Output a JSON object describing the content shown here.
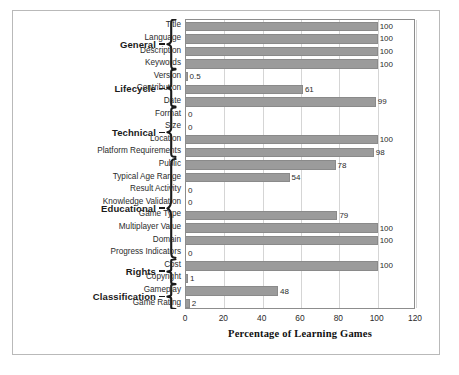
{
  "chart_data": {
    "type": "bar",
    "orientation": "horizontal",
    "title": "",
    "xlabel": "Percentage of Learning Games",
    "ylabel": "",
    "xlim": [
      0,
      120
    ],
    "xticks": [
      0,
      20,
      40,
      60,
      80,
      100,
      120
    ],
    "grid": true,
    "legend": false,
    "bar_color": "#9b9b9b",
    "categories": [
      "Title",
      "Language",
      "Description",
      "Keywords",
      "Version",
      "Contribution",
      "Date",
      "Format",
      "Size",
      "Location",
      "Platform Requirements",
      "Public",
      "Typical Age Range",
      "Result Activity",
      "Knowledge Validation",
      "Game Type",
      "Multiplayer Value",
      "Domain",
      "Progress Indicators",
      "Cost",
      "Copyright",
      "Gameplay",
      "Game Rating"
    ],
    "values": [
      100,
      100,
      100,
      100,
      0.5,
      61,
      99,
      0,
      0,
      100,
      98,
      78,
      54,
      0,
      0,
      79,
      100,
      100,
      0,
      100,
      1,
      48,
      2
    ],
    "value_labels": [
      "100",
      "100",
      "100",
      "100",
      "0.5",
      "61",
      "99",
      "0",
      "0",
      "100",
      "98",
      "78",
      "54",
      "0",
      "0",
      "79",
      "100",
      "100",
      "0",
      "100",
      "1",
      "48",
      "2"
    ],
    "groups": [
      {
        "label": "General",
        "start": 0,
        "end": 3
      },
      {
        "label": "Lifecycle",
        "start": 4,
        "end": 6
      },
      {
        "label": "Technical",
        "start": 7,
        "end": 10
      },
      {
        "label": "Educational",
        "start": 11,
        "end": 18
      },
      {
        "label": "Rights",
        "start": 19,
        "end": 20
      },
      {
        "label": "Classification",
        "start": 21,
        "end": 22
      }
    ]
  }
}
